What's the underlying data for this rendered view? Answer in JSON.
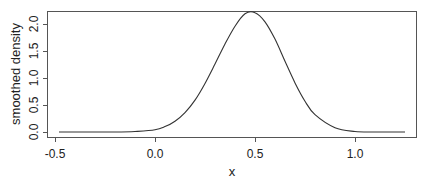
{
  "chart_data": {
    "type": "line",
    "title": "",
    "xlabel": "x",
    "ylabel": "smoothed density",
    "xlim": [
      -0.5,
      1.3
    ],
    "ylim": [
      0.0,
      2.3
    ],
    "x_ticks": [
      -0.5,
      0.0,
      0.5,
      1.0
    ],
    "x_tick_labels": [
      "-0.5",
      "0.0",
      "0.5",
      "1.0"
    ],
    "y_ticks": [
      0.0,
      0.5,
      1.0,
      1.5,
      2.0
    ],
    "y_tick_labels": [
      "0.0",
      "0.5",
      "1.0",
      "1.5",
      "2.0"
    ],
    "grid": false,
    "legend": null,
    "series": [
      {
        "name": "smoothed density",
        "color": "#333333",
        "x": [
          -0.48,
          -0.3,
          -0.2,
          -0.1,
          0.0,
          0.05,
          0.1,
          0.15,
          0.2,
          0.25,
          0.3,
          0.35,
          0.4,
          0.45,
          0.5,
          0.55,
          0.6,
          0.65,
          0.7,
          0.75,
          0.8,
          0.9,
          1.0,
          1.1,
          1.25
        ],
        "y": [
          0.0,
          0.0,
          0.0,
          0.01,
          0.04,
          0.1,
          0.2,
          0.36,
          0.59,
          0.9,
          1.26,
          1.63,
          1.96,
          2.19,
          2.21,
          2.04,
          1.72,
          1.31,
          0.91,
          0.57,
          0.32,
          0.08,
          0.01,
          0.0,
          0.0
        ]
      }
    ]
  },
  "plot": {
    "xlabel": "x",
    "ylabel": "smoothed density",
    "x_tick_labels": [
      "-0.5",
      "0.0",
      "0.5",
      "1.0"
    ],
    "y_tick_labels": [
      "0.0",
      "0.5",
      "1.0",
      "1.5",
      "2.0"
    ]
  }
}
